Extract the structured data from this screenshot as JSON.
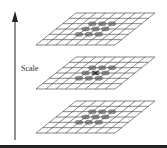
{
  "diagram": {
    "axis_label": "Scale",
    "axis_direction": "up",
    "layers": [
      {
        "name": "top-layer",
        "grid_cols": 8,
        "grid_rows": 6,
        "highlighted_neighborhood": "3x3",
        "center_marker": false
      },
      {
        "name": "middle-layer",
        "grid_cols": 8,
        "grid_rows": 6,
        "highlighted_neighborhood": "3x3",
        "center_marker": true
      },
      {
        "name": "bottom-layer",
        "grid_cols": 8,
        "grid_rows": 6,
        "highlighted_neighborhood": "3x3",
        "center_marker": false
      }
    ],
    "colors": {
      "grid_line": "#555555",
      "sample_fill": "#9a9a9a",
      "arrow": "#222222",
      "rule": "#222222"
    }
  }
}
